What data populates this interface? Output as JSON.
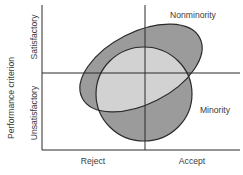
{
  "diagram": {
    "y_axis_title": "Performance criterion",
    "y_categories": {
      "upper": "Satisfactory",
      "lower": "Unsatisfactory"
    },
    "x_categories": {
      "left": "Reject",
      "right": "Accept"
    },
    "groups": [
      {
        "name": "Nonminority",
        "shape": "tilted-ellipse",
        "fill": "#9b9b9b"
      },
      {
        "name": "Minority",
        "shape": "circle",
        "fill": "#9b9b9b"
      }
    ],
    "overlap_fill": "#d2d2d2",
    "line_color": "#2a2a2a"
  }
}
